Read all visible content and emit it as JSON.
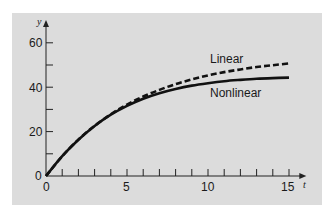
{
  "chart_data": {
    "type": "line",
    "title": "",
    "xlabel": "t",
    "ylabel": "y",
    "xlim": [
      0,
      15
    ],
    "ylim": [
      0,
      65
    ],
    "x_ticks": [
      0,
      5,
      10,
      15
    ],
    "x_minor_ticks": [
      1,
      2,
      3,
      4,
      6,
      7,
      8,
      9,
      11,
      12,
      13,
      14
    ],
    "y_ticks": [
      0,
      20,
      40,
      60
    ],
    "y_minor_ticks": [
      10,
      30,
      50
    ],
    "grid": false,
    "legend": "inline labels",
    "x": [
      0,
      1,
      2,
      3,
      4,
      5,
      6,
      7,
      8,
      9,
      10,
      11,
      12,
      13,
      14,
      15
    ],
    "series": [
      {
        "name": "Linear",
        "style": "dashed",
        "values": [
          0,
          8.9,
          16.4,
          22.6,
          27.8,
          32.2,
          35.8,
          38.8,
          41.4,
          43.5,
          45.3,
          46.8,
          48.0,
          49.1,
          49.9,
          50.7
        ]
      },
      {
        "name": "Nonlinear",
        "style": "solid",
        "values": [
          0,
          8.9,
          16.3,
          22.5,
          27.6,
          31.6,
          34.8,
          37.3,
          39.2,
          40.7,
          41.8,
          42.7,
          43.3,
          43.8,
          44.1,
          44.3
        ]
      }
    ],
    "annotations": [
      "Linear",
      "Nonlinear"
    ]
  },
  "labels": {
    "y_axis": "y",
    "x_axis": "t",
    "linear": "Linear",
    "nonlinear": "Nonlinear",
    "y0": "0",
    "y20": "20",
    "y40": "40",
    "y60": "60",
    "x0": "0",
    "x5": "5",
    "x10": "10",
    "x15": "15"
  }
}
